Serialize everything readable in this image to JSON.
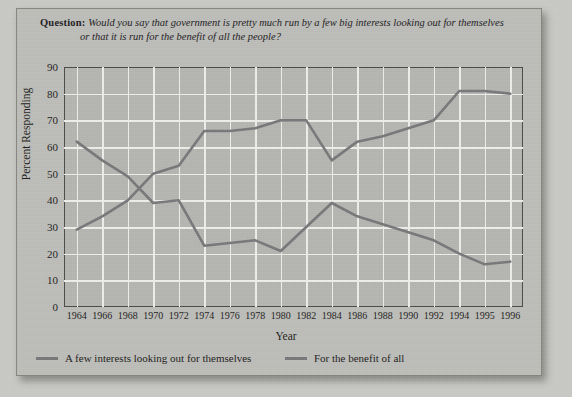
{
  "question": {
    "label": "Question",
    "separator": ":",
    "line1": "Would you say that government is pretty much run by a few big interests looking out for themselves",
    "line2": "or that it is run for the benefit of all the people?"
  },
  "chart_data": {
    "type": "line",
    "title": "",
    "xlabel": "Year",
    "ylabel": "Percent Responding",
    "ylim": [
      0,
      90
    ],
    "ytick_step": 10,
    "yticks": [
      0,
      10,
      20,
      30,
      40,
      50,
      60,
      70,
      80,
      90
    ],
    "grid": true,
    "legend_position": "bottom",
    "line_color": "#78787a",
    "grid_color": "#ededea",
    "plot_background": "#b5b5b1",
    "categories": [
      "1964",
      "1966",
      "1968",
      "1970",
      "1972",
      "1974",
      "1976",
      "1978",
      "1980",
      "1982",
      "1984",
      "1986",
      "1988",
      "1990",
      "1992",
      "1994",
      "1995",
      "1996"
    ],
    "series": [
      {
        "name": "A few interests looking out for themselves",
        "values": [
          29,
          34,
          40,
          50,
          53,
          66,
          66,
          67,
          70,
          70,
          55,
          62,
          64,
          67,
          70,
          81,
          81,
          80
        ]
      },
      {
        "name": "For the benefit of all",
        "values": [
          62,
          55,
          49,
          39,
          40,
          23,
          24,
          25,
          21,
          30,
          39,
          34,
          31,
          28,
          25,
          20,
          16,
          17
        ]
      }
    ]
  }
}
